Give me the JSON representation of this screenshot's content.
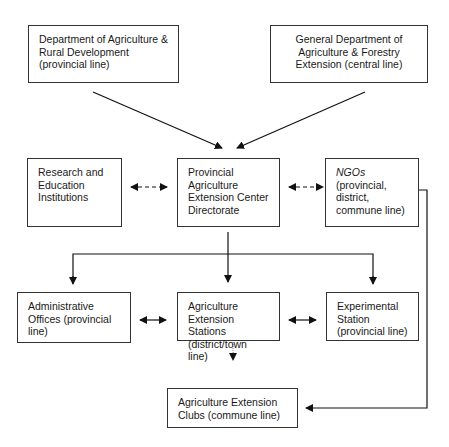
{
  "nodes": {
    "dard": {
      "text": "Department of Agriculture &\nRural Development\n(provincial line)"
    },
    "gdaf": {
      "text": "General Department of\nAgriculture & Forestry\nExtension (central line)"
    },
    "research": {
      "text": "Research and\nEducation\nInstitutions"
    },
    "paecd": {
      "text": "Provincial\nAgriculture\nExtension Center\nDirectorate"
    },
    "ngos": {
      "title": "NGOs",
      "text": "(provincial,\ndistrict,\ncommune line)"
    },
    "admin": {
      "text": "Administrative\nOffices (provincial\nline)"
    },
    "stations": {
      "text": "Agriculture\nExtension Stations\n(district/town line)"
    },
    "experimental": {
      "text": "Experimental\nStation\n(provincial line)"
    },
    "clubs": {
      "text": "Agriculture Extension\nClubs (commune line)"
    }
  },
  "edges": [
    {
      "from": "dard",
      "to": "paecd",
      "style": "solid"
    },
    {
      "from": "gdaf",
      "to": "paecd",
      "style": "solid"
    },
    {
      "from": "research",
      "to": "paecd",
      "style": "dashed-bidirectional"
    },
    {
      "from": "paecd",
      "to": "ngos",
      "style": "dashed-bidirectional"
    },
    {
      "from": "paecd",
      "to": "admin",
      "style": "solid"
    },
    {
      "from": "paecd",
      "to": "stations",
      "style": "solid"
    },
    {
      "from": "paecd",
      "to": "experimental",
      "style": "solid"
    },
    {
      "from": "admin",
      "to": "stations",
      "style": "solid-bidirectional"
    },
    {
      "from": "stations",
      "to": "experimental",
      "style": "solid-bidirectional"
    },
    {
      "from": "stations",
      "to": "clubs",
      "style": "dotted"
    },
    {
      "from": "ngos",
      "to": "clubs",
      "style": "solid"
    }
  ]
}
